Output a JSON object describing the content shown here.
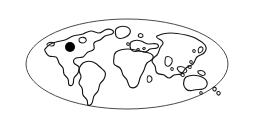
{
  "logo": {
    "title": "World Map Globe Logo",
    "alt_text": "Oval world map outline with a location marker over North America",
    "background_color": "#ffffff"
  },
  "frame": {
    "name": "oval-globe-frame",
    "shape": "ellipse",
    "center_x": 127,
    "center_y": 64,
    "radius_x": 101,
    "radius_y": 45,
    "stroke_color": "#4a4a4a",
    "fill_color": "#ffffff",
    "stroke_width": 1
  },
  "map": {
    "projection": "oval-world",
    "outline_color": "#161616",
    "fill_color": "none",
    "continents": [
      {
        "name": "north-america",
        "label": "North America"
      },
      {
        "name": "greenland",
        "label": "Greenland"
      },
      {
        "name": "south-america",
        "label": "South America"
      },
      {
        "name": "africa",
        "label": "Africa"
      },
      {
        "name": "europe",
        "label": "Europe"
      },
      {
        "name": "asia",
        "label": "Asia"
      },
      {
        "name": "australia",
        "label": "Australia"
      },
      {
        "name": "new-zealand",
        "label": "New Zealand"
      },
      {
        "name": "japan",
        "label": "Japan"
      },
      {
        "name": "indonesia",
        "label": "Indonesia"
      },
      {
        "name": "british-isles",
        "label": "British Isles"
      },
      {
        "name": "madagascar",
        "label": "Madagascar"
      },
      {
        "name": "sri-lanka",
        "label": "Sri Lanka"
      },
      {
        "name": "iceland",
        "label": "Iceland"
      }
    ]
  },
  "marker": {
    "name": "location-marker-dot",
    "label": "Location marker",
    "region": "North America",
    "center_x": 70,
    "center_y": 47,
    "radius": 5,
    "color": "#000000"
  }
}
